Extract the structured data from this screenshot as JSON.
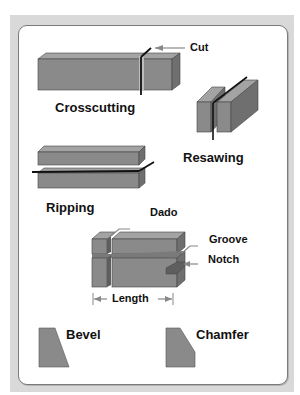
{
  "diagram": {
    "colors": {
      "frame": "#d9d9d9",
      "panel_border": "#7a7a7a",
      "wood_front": "#8a8a8a",
      "wood_top": "#a3a3a3",
      "wood_side": "#6f6f6f",
      "blade": "#111111",
      "arrow": "#888888"
    },
    "cuts": [
      {
        "id": "crosscutting",
        "label": "Crosscutting"
      },
      {
        "id": "resawing",
        "label": "Resawing"
      },
      {
        "id": "ripping",
        "label": "Ripping"
      }
    ],
    "callouts": {
      "cut": "Cut",
      "dado": "Dado",
      "groove": "Groove",
      "notch": "Notch",
      "length": "Length"
    },
    "edges": [
      {
        "id": "bevel",
        "label": "Bevel"
      },
      {
        "id": "chamfer",
        "label": "Chamfer"
      }
    ]
  }
}
